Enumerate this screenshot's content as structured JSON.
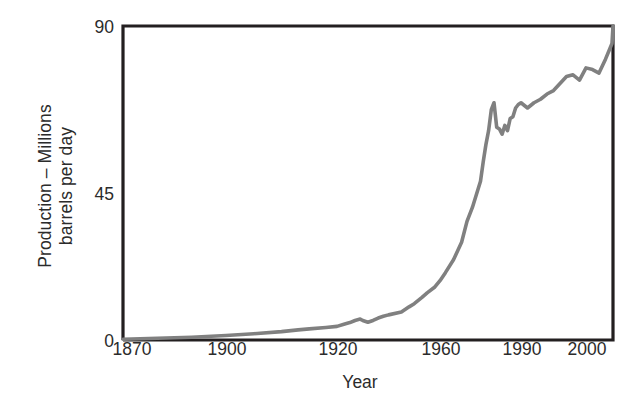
{
  "chart_data": {
    "type": "line",
    "title": "",
    "xlabel": "Year",
    "ylabel": "Production – Millions barrels per day",
    "ylabel_line1": "Production – Millions",
    "ylabel_line2": "barrels per day",
    "xlim": [
      1870,
      2005
    ],
    "ylim": [
      0,
      90
    ],
    "grid": false,
    "legend": false,
    "line_color": "#808080",
    "axis_color": "#231f20",
    "yticks": [
      "0",
      "45",
      "90"
    ],
    "ytick_values": [
      0,
      45,
      90
    ],
    "xticks": [
      "1870",
      "1900",
      "1920",
      "1960",
      "1990",
      "2000"
    ],
    "xtick_values": [
      1870,
      1900,
      1920,
      1960,
      1990,
      2000
    ],
    "xtick_pixels": [
      123,
      226,
      337,
      440,
      521,
      586
    ],
    "series": [
      {
        "name": "World oil production",
        "units": "millions of barrels per day",
        "x": [
          1870,
          1880,
          1890,
          1900,
          1905,
          1910,
          1913,
          1915,
          1918,
          1920,
          1923,
          1925,
          1927,
          1929,
          1930,
          1932,
          1934,
          1936,
          1938,
          1940,
          1945,
          1948,
          1950,
          1953,
          1955,
          1958,
          1960,
          1962,
          1965,
          1968,
          1970,
          1972,
          1974,
          1975,
          1976,
          1977,
          1978,
          1979,
          1980,
          1981,
          1982,
          1983,
          1984,
          1985,
          1986,
          1987,
          1988,
          1989,
          1990,
          1991,
          1992,
          1993,
          1994,
          1995,
          1996,
          1997,
          1998,
          1999,
          2000,
          2001,
          2002,
          2003,
          2004,
          2005
        ],
        "y": [
          0.2,
          0.5,
          0.8,
          1.3,
          1.8,
          2.4,
          2.9,
          3.2,
          3.6,
          3.9,
          4.6,
          5.0,
          5.6,
          6.0,
          5.6,
          5.1,
          5.6,
          6.3,
          6.8,
          7.2,
          8.0,
          9.5,
          10.4,
          12.2,
          13.5,
          15.2,
          17.0,
          19.3,
          23.0,
          28.0,
          34.0,
          38.0,
          43.0,
          45.5,
          51.0,
          56.0,
          60.0,
          66.0,
          68.0,
          61.0,
          60.5,
          59.0,
          61.5,
          60.0,
          63.5,
          64.0,
          66.5,
          67.5,
          68.0,
          66.5,
          68.0,
          69.0,
          70.5,
          71.5,
          73.5,
          75.5,
          76.0,
          74.5,
          78.0,
          77.5,
          76.5,
          80.5,
          85.0,
          90.0
        ]
      }
    ]
  },
  "axis_titles": {
    "x": "Year",
    "y_line1": "Production – Millions",
    "y_line2": "barrels per day"
  }
}
